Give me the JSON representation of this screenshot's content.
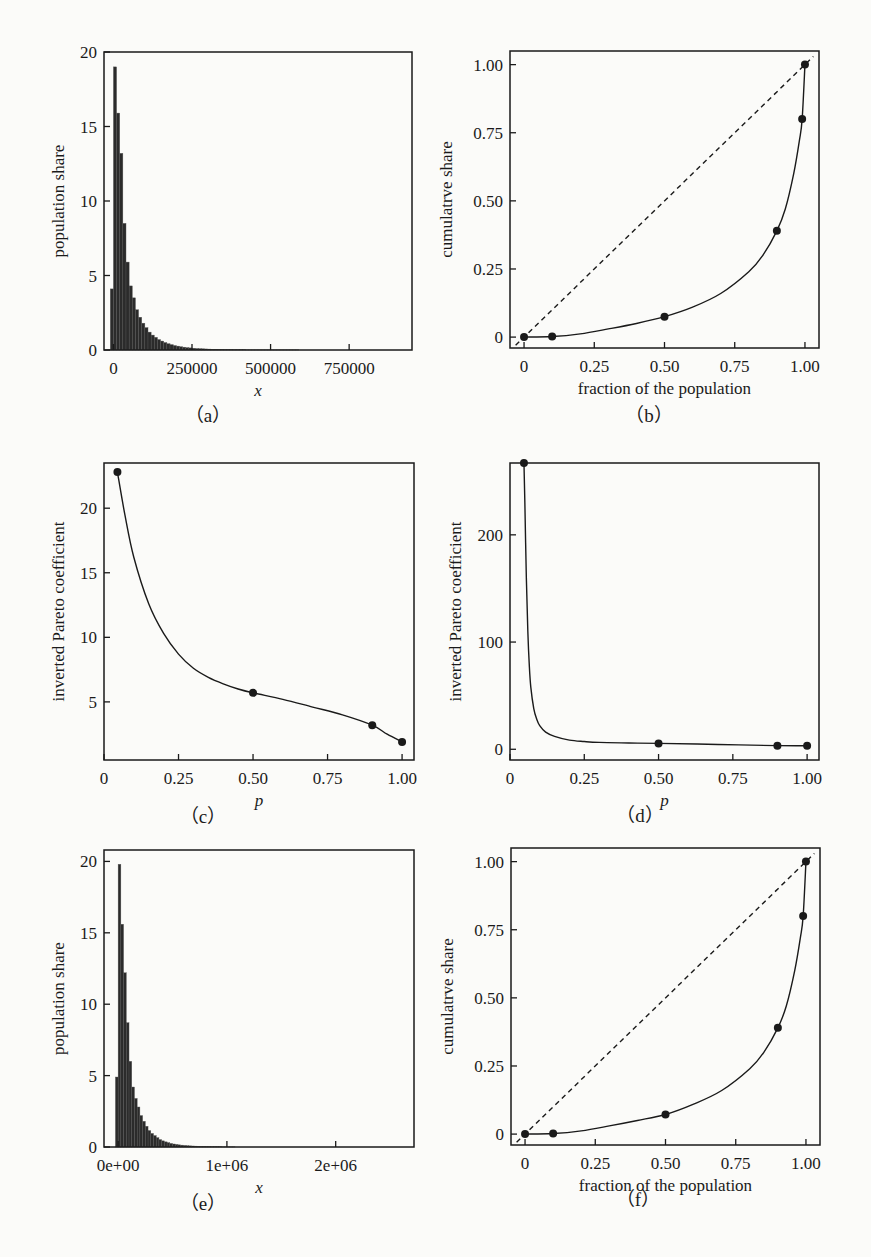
{
  "chart_data": [
    {
      "id": "a",
      "caption": "（a）",
      "type": "bar",
      "title": "",
      "xlabel": "x",
      "ylabel": "population share",
      "xlim": [
        -30000,
        950000
      ],
      "ylim": [
        0,
        20
      ],
      "xticks": [
        0,
        250000,
        500000,
        750000
      ],
      "xtick_labels": [
        "0",
        "250000",
        "500000",
        "750000"
      ],
      "yticks": [
        0,
        5,
        10,
        15,
        20
      ],
      "ytick_labels": [
        "0",
        "5",
        "10",
        "15",
        "20"
      ],
      "bin_width": 10000,
      "bin_start": -10000,
      "values": [
        4.1,
        19.0,
        15.9,
        13.2,
        8.5,
        5.9,
        4.3,
        3.5,
        2.7,
        2.2,
        1.8,
        1.5,
        1.2,
        1.0,
        0.85,
        0.7,
        0.6,
        0.5,
        0.42,
        0.36,
        0.3,
        0.26,
        0.22,
        0.19,
        0.16,
        0.14,
        0.12,
        0.1,
        0.09,
        0.08,
        0.07,
        0.06,
        0.05,
        0.05,
        0.04,
        0.04,
        0.03,
        0.03,
        0.03,
        0.02,
        0.02,
        0.02,
        0.02,
        0.01,
        0.01,
        0.01,
        0.01,
        0.01,
        0.01,
        0.01,
        0.01,
        0.01,
        0.01,
        0.01,
        0.01,
        0.01,
        0.01,
        0.01,
        0.01,
        0.01
      ]
    },
    {
      "id": "b",
      "caption": "（b）",
      "type": "line",
      "title": "",
      "xlabel": "fraction of the population",
      "ylabel": "cumulatrve share",
      "xlim": [
        -0.05,
        1.05
      ],
      "ylim": [
        -0.04,
        1.05
      ],
      "xticks": [
        0,
        0.25,
        0.5,
        0.75,
        1.0
      ],
      "xtick_labels": [
        "0",
        "0.25",
        "0.50",
        "0.75",
        "1.00"
      ],
      "yticks": [
        0,
        0.25,
        0.5,
        0.75,
        1.0
      ],
      "ytick_labels": [
        "0",
        "0.25",
        "0.50",
        "0.75",
        "1.00"
      ],
      "series": [
        {
          "name": "Lorenz curve",
          "style": "solid",
          "x": [
            0,
            0.1,
            0.2,
            0.3,
            0.4,
            0.5,
            0.6,
            0.7,
            0.8,
            0.85,
            0.9,
            0.93,
            0.96,
            0.98,
            0.99,
            1.0
          ],
          "y": [
            0,
            0.002,
            0.012,
            0.03,
            0.05,
            0.075,
            0.11,
            0.16,
            0.24,
            0.3,
            0.39,
            0.47,
            0.6,
            0.72,
            0.8,
            1.0
          ]
        },
        {
          "name": "equality line",
          "style": "dashed",
          "x": [
            -0.03,
            1.03
          ],
          "y": [
            -0.03,
            1.03
          ]
        }
      ],
      "points": {
        "x": [
          0,
          0.1,
          0.5,
          0.9,
          0.99,
          1.0
        ],
        "y": [
          0,
          0.002,
          0.075,
          0.39,
          0.8,
          1.0
        ]
      }
    },
    {
      "id": "c",
      "caption": "（c）",
      "type": "line",
      "title": "",
      "xlabel": "p",
      "ylabel": "inverted Pareto coefficient",
      "xlim": [
        0,
        1.04
      ],
      "ylim": [
        0.5,
        23.5
      ],
      "xticks": [
        0,
        0.25,
        0.5,
        0.75,
        1.0
      ],
      "xtick_labels": [
        "0",
        "0.25",
        "0.50",
        "0.75",
        "1.00"
      ],
      "yticks": [
        5,
        10,
        15,
        20
      ],
      "ytick_labels": [
        "5",
        "10",
        "15",
        "20"
      ],
      "series": [
        {
          "name": "b(p)",
          "style": "solid",
          "x": [
            0.045,
            0.07,
            0.1,
            0.15,
            0.2,
            0.25,
            0.3,
            0.35,
            0.4,
            0.45,
            0.5,
            0.6,
            0.7,
            0.8,
            0.9,
            0.95,
            1.0
          ],
          "y": [
            22.8,
            19.5,
            16.2,
            12.6,
            10.3,
            8.7,
            7.6,
            6.9,
            6.4,
            6.0,
            5.7,
            5.2,
            4.6,
            4.0,
            3.2,
            2.5,
            1.9
          ]
        }
      ],
      "points": {
        "x": [
          0.045,
          0.5,
          0.9,
          1.0
        ],
        "y": [
          22.8,
          5.7,
          3.2,
          1.9
        ]
      }
    },
    {
      "id": "d",
      "caption": "（d）",
      "type": "line",
      "title": "",
      "xlabel": "p",
      "ylabel": "inverted Pareto coefficient",
      "xlim": [
        0,
        1.04
      ],
      "ylim": [
        -10,
        267
      ],
      "xticks": [
        0,
        0.25,
        0.5,
        0.75,
        1.0
      ],
      "xtick_labels": [
        "0",
        "0.25",
        "0.50",
        "0.75",
        "1.00"
      ],
      "yticks": [
        0,
        100,
        200
      ],
      "ytick_labels": [
        "0",
        "100",
        "200"
      ],
      "series": [
        {
          "name": "b(p)",
          "style": "solid",
          "x": [
            0.047,
            0.05,
            0.055,
            0.06,
            0.065,
            0.07,
            0.08,
            0.09,
            0.1,
            0.12,
            0.15,
            0.2,
            0.25,
            0.3,
            0.4,
            0.5,
            0.7,
            0.9,
            1.0
          ],
          "y": [
            267,
            230,
            160,
            110,
            78,
            58,
            38,
            28,
            22,
            16,
            12,
            8.5,
            7.2,
            6.4,
            5.9,
            5.5,
            4.5,
            3.4,
            3.3
          ]
        }
      ],
      "points": {
        "x": [
          0.047,
          0.5,
          0.9,
          1.0
        ],
        "y": [
          267,
          5.5,
          3.4,
          3.3
        ]
      }
    },
    {
      "id": "e",
      "caption": "（e）",
      "type": "bar",
      "title": "",
      "xlabel": "x",
      "ylabel": "population share",
      "xlim": [
        -130000,
        2720000
      ],
      "ylim": [
        0,
        20.8
      ],
      "xticks": [
        0,
        1000000,
        2000000
      ],
      "xtick_labels": [
        "0e+00",
        "1e+06",
        "2e+06"
      ],
      "yticks": [
        0,
        5,
        10,
        15,
        20
      ],
      "ytick_labels": [
        "0",
        "5",
        "10",
        "15",
        "20"
      ],
      "bin_width": 25000,
      "bin_start": -25000,
      "values": [
        4.9,
        19.8,
        15.6,
        12.2,
        8.7,
        6.0,
        4.2,
        3.4,
        2.8,
        2.2,
        1.8,
        1.45,
        1.15,
        0.95,
        0.8,
        0.65,
        0.52,
        0.43,
        0.36,
        0.3,
        0.25,
        0.21,
        0.18,
        0.15,
        0.13,
        0.11,
        0.09,
        0.08,
        0.07,
        0.06,
        0.05,
        0.04,
        0.04,
        0.03,
        0.03,
        0.02,
        0.02,
        0.02,
        0.02,
        0.01,
        0.01,
        0.01,
        0.01,
        0.01
      ]
    },
    {
      "id": "f",
      "caption": "（f）",
      "type": "line",
      "title": "",
      "xlabel": "fraction of the population",
      "ylabel": "cumulatrve share",
      "xlim": [
        -0.05,
        1.05
      ],
      "ylim": [
        -0.04,
        1.05
      ],
      "xticks": [
        0,
        0.25,
        0.5,
        0.75,
        1.0
      ],
      "xtick_labels": [
        "0",
        "0.25",
        "0.50",
        "0.75",
        "1.00"
      ],
      "yticks": [
        0,
        0.25,
        0.5,
        0.75,
        1.0
      ],
      "ytick_labels": [
        "0",
        "0.25",
        "0.50",
        "0.75",
        "1.00"
      ],
      "series": [
        {
          "name": "Lorenz curve",
          "style": "solid",
          "x": [
            0,
            0.1,
            0.2,
            0.3,
            0.4,
            0.5,
            0.6,
            0.7,
            0.8,
            0.85,
            0.9,
            0.93,
            0.96,
            0.98,
            0.99,
            1.0
          ],
          "y": [
            0,
            0.002,
            0.012,
            0.03,
            0.05,
            0.072,
            0.11,
            0.16,
            0.24,
            0.3,
            0.39,
            0.47,
            0.6,
            0.72,
            0.8,
            1.0
          ]
        },
        {
          "name": "equality line",
          "style": "dashed",
          "x": [
            -0.03,
            1.03
          ],
          "y": [
            -0.03,
            1.03
          ]
        }
      ],
      "points": {
        "x": [
          0,
          0.1,
          0.5,
          0.9,
          0.99,
          1.0
        ],
        "y": [
          0,
          0.002,
          0.072,
          0.39,
          0.8,
          1.0
        ]
      }
    }
  ],
  "layout": {
    "frames": {
      "a": {
        "left": 104,
        "top": 52,
        "right": 412,
        "bottom": 350
      },
      "b": {
        "left": 510,
        "top": 51,
        "right": 819,
        "bottom": 348
      },
      "c": {
        "left": 104,
        "top": 463,
        "right": 414,
        "bottom": 760
      },
      "d": {
        "left": 510,
        "top": 463,
        "right": 819,
        "bottom": 760
      },
      "e": {
        "left": 104,
        "top": 850,
        "right": 414,
        "bottom": 1147
      },
      "f": {
        "left": 511,
        "top": 848,
        "right": 820,
        "bottom": 1145
      }
    },
    "captions": {
      "a": {
        "x": 208,
        "y": 412
      },
      "b": {
        "x": 649,
        "y": 412
      },
      "c": {
        "x": 203,
        "y": 813
      },
      "d": {
        "x": 640,
        "y": 812
      },
      "e": {
        "x": 203,
        "y": 1200
      },
      "f": {
        "x": 638,
        "y": 1196
      }
    },
    "colors": {
      "ink": "#1a1a1a",
      "bar": "#2b2b2b",
      "background": "#fbfbf9"
    }
  }
}
